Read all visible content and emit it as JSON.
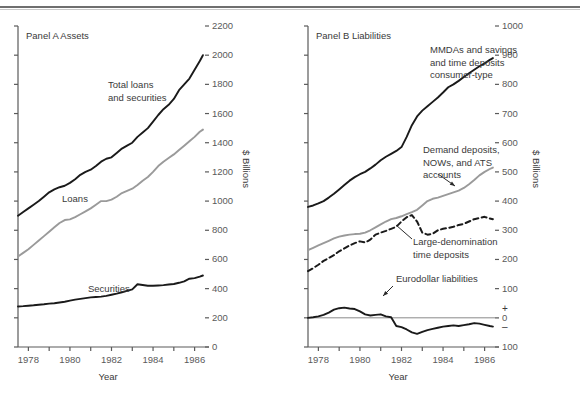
{
  "figure": {
    "panels": [
      {
        "id": "A",
        "title": "Panel A Assets",
        "xlabel": "Year",
        "ylabel": "$ Billions",
        "yticks": [
          "0",
          "200",
          "400",
          "600",
          "800",
          "1000",
          "1200",
          "1400",
          "1600",
          "1800",
          "2000",
          "2200"
        ],
        "xticks": [
          "1978",
          "1980",
          "1982",
          "1984",
          "1986"
        ],
        "annotations": [
          {
            "name": "total-loans-and-securities",
            "lines": [
              "Total loans",
              "and securities"
            ]
          },
          {
            "name": "loans",
            "lines": [
              "Loans"
            ]
          },
          {
            "name": "securities",
            "lines": [
              "Securities"
            ]
          }
        ]
      },
      {
        "id": "B",
        "title": "Panel B Liabilities",
        "xlabel": "Year",
        "ylabel": "$ Billions",
        "yticks": [
          "100",
          "0",
          "100",
          "200",
          "300",
          "400",
          "500",
          "600",
          "700",
          "800",
          "900",
          "1000"
        ],
        "xticks": [
          "1978",
          "1980",
          "1982",
          "1984",
          "1986"
        ],
        "signs": {
          "plus": "+",
          "minus": "–"
        },
        "annotations": [
          {
            "name": "mmdas-and-savings",
            "lines": [
              "MMDAs and savings",
              "and time deposits",
              "consumer-type"
            ]
          },
          {
            "name": "demand-deposits-nows-ats",
            "lines": [
              "Demand deposits,",
              "NOWs, and ATS",
              "accounts"
            ]
          },
          {
            "name": "large-denomination-time-deposits",
            "lines": [
              "Large-denomination",
              "time deposits"
            ]
          },
          {
            "name": "eurodollar-liabilities",
            "lines": [
              "Eurodollar liabilities"
            ]
          }
        ]
      }
    ]
  },
  "chart_data": [
    {
      "type": "line",
      "title": "Panel A Assets",
      "xlabel": "Year",
      "ylabel": "$ Billions",
      "xlim": [
        1977.5,
        1986.5
      ],
      "ylim": [
        0,
        2200
      ],
      "ytick_step": 200,
      "grid": false,
      "legend": "inline-annotations",
      "series": [
        {
          "name": "Total loans and securities",
          "color": "#1a1a1a",
          "style": "solid",
          "x": [
            1977.5,
            1977.75,
            1978,
            1978.25,
            1978.5,
            1978.75,
            1979,
            1979.25,
            1979.5,
            1979.75,
            1980,
            1980.25,
            1980.5,
            1980.75,
            1981,
            1981.25,
            1981.5,
            1981.75,
            1982,
            1982.25,
            1982.5,
            1982.75,
            1983,
            1983.25,
            1983.5,
            1983.75,
            1984,
            1984.25,
            1984.5,
            1984.75,
            1985,
            1985.25,
            1985.5,
            1985.75,
            1986,
            1986.25,
            1986.4
          ],
          "values": [
            900,
            925,
            950,
            975,
            1000,
            1030,
            1060,
            1080,
            1095,
            1105,
            1125,
            1150,
            1180,
            1200,
            1215,
            1240,
            1270,
            1290,
            1300,
            1330,
            1360,
            1380,
            1400,
            1440,
            1470,
            1500,
            1545,
            1590,
            1630,
            1660,
            1700,
            1760,
            1800,
            1840,
            1900,
            1960,
            2000
          ]
        },
        {
          "name": "Loans",
          "color": "#9a9a9a",
          "style": "solid",
          "x": [
            1977.5,
            1977.75,
            1978,
            1978.25,
            1978.5,
            1978.75,
            1979,
            1979.25,
            1979.5,
            1979.75,
            1980,
            1980.25,
            1980.5,
            1980.75,
            1981,
            1981.25,
            1981.5,
            1981.75,
            1982,
            1982.25,
            1982.5,
            1982.75,
            1983,
            1983.25,
            1983.5,
            1983.75,
            1984,
            1984.25,
            1984.5,
            1984.75,
            1985,
            1985.25,
            1985.5,
            1985.75,
            1986,
            1986.25,
            1986.4
          ],
          "values": [
            620,
            645,
            670,
            700,
            730,
            760,
            790,
            820,
            850,
            870,
            875,
            890,
            910,
            930,
            950,
            975,
            1000,
            1000,
            1010,
            1030,
            1055,
            1070,
            1085,
            1110,
            1140,
            1165,
            1200,
            1240,
            1270,
            1295,
            1320,
            1350,
            1380,
            1410,
            1440,
            1475,
            1490
          ]
        },
        {
          "name": "Securities",
          "color": "#1a1a1a",
          "style": "solid",
          "x": [
            1977.5,
            1977.75,
            1978,
            1978.25,
            1978.5,
            1978.75,
            1979,
            1979.25,
            1979.5,
            1979.75,
            1980,
            1980.25,
            1980.5,
            1980.75,
            1981,
            1981.25,
            1981.5,
            1981.75,
            1982,
            1982.25,
            1982.5,
            1982.75,
            1983,
            1983.25,
            1983.5,
            1983.75,
            1984,
            1984.25,
            1984.5,
            1984.75,
            1985,
            1985.25,
            1985.5,
            1985.75,
            1986,
            1986.25,
            1986.4
          ],
          "values": [
            278,
            280,
            283,
            286,
            290,
            293,
            297,
            300,
            305,
            310,
            318,
            325,
            330,
            335,
            340,
            343,
            345,
            350,
            358,
            366,
            375,
            385,
            395,
            430,
            425,
            420,
            420,
            422,
            424,
            428,
            432,
            440,
            450,
            468,
            472,
            482,
            490
          ]
        }
      ]
    },
    {
      "type": "line",
      "title": "Panel B Liabilities",
      "xlabel": "Year",
      "ylabel": "$ Billions",
      "xlim": [
        1977.5,
        1986.5
      ],
      "ylim": [
        -100,
        1000
      ],
      "ytick_step": 100,
      "grid": false,
      "zero_reference_line": true,
      "legend": "inline-annotations",
      "series": [
        {
          "name": "MMDAs and savings and time deposits consumer-type",
          "color": "#1a1a1a",
          "style": "solid",
          "x": [
            1977.5,
            1977.75,
            1978,
            1978.25,
            1978.5,
            1978.75,
            1979,
            1979.25,
            1979.5,
            1979.75,
            1980,
            1980.25,
            1980.5,
            1980.75,
            1981,
            1981.25,
            1981.5,
            1981.75,
            1982,
            1982.25,
            1982.5,
            1982.75,
            1983,
            1983.25,
            1983.5,
            1983.75,
            1984,
            1984.25,
            1984.5,
            1984.75,
            1985,
            1985.25,
            1985.5,
            1985.75,
            1986,
            1986.25,
            1986.4
          ],
          "values": [
            380,
            385,
            392,
            400,
            412,
            425,
            440,
            455,
            470,
            482,
            492,
            500,
            512,
            525,
            540,
            552,
            562,
            572,
            585,
            620,
            660,
            690,
            710,
            725,
            740,
            755,
            772,
            790,
            800,
            812,
            825,
            838,
            850,
            862,
            872,
            884,
            890
          ]
        },
        {
          "name": "Demand deposits, NOWs, and ATS accounts",
          "color": "#9a9a9a",
          "style": "solid",
          "x": [
            1977.5,
            1977.75,
            1978,
            1978.25,
            1978.5,
            1978.75,
            1979,
            1979.25,
            1979.5,
            1979.75,
            1980,
            1980.25,
            1980.5,
            1980.75,
            1981,
            1981.25,
            1981.5,
            1981.75,
            1982,
            1982.25,
            1982.5,
            1982.75,
            1983,
            1983.25,
            1983.5,
            1983.75,
            1984,
            1984.25,
            1984.5,
            1984.75,
            1985,
            1985.25,
            1985.5,
            1985.75,
            1986,
            1986.25,
            1986.4
          ],
          "values": [
            232,
            240,
            248,
            256,
            264,
            272,
            278,
            282,
            285,
            287,
            288,
            292,
            300,
            310,
            320,
            330,
            338,
            342,
            348,
            355,
            362,
            370,
            385,
            400,
            408,
            412,
            418,
            424,
            430,
            436,
            445,
            458,
            472,
            488,
            500,
            510,
            515
          ]
        },
        {
          "name": "Large-denomination time deposits",
          "color": "#1a1a1a",
          "style": "dashed",
          "x": [
            1977.5,
            1977.75,
            1978,
            1978.25,
            1978.5,
            1978.75,
            1979,
            1979.25,
            1979.5,
            1979.75,
            1980,
            1980.25,
            1980.5,
            1980.75,
            1981,
            1981.25,
            1981.5,
            1981.75,
            1982,
            1982.25,
            1982.5,
            1982.75,
            1983,
            1983.25,
            1983.5,
            1983.75,
            1984,
            1984.25,
            1984.5,
            1984.75,
            1985,
            1985.25,
            1985.5,
            1985.75,
            1986,
            1986.25,
            1986.4
          ],
          "values": [
            160,
            170,
            182,
            195,
            205,
            215,
            228,
            238,
            248,
            256,
            262,
            258,
            268,
            285,
            292,
            298,
            305,
            312,
            330,
            345,
            352,
            330,
            292,
            285,
            288,
            300,
            305,
            308,
            312,
            318,
            322,
            330,
            338,
            342,
            346,
            340,
            338
          ]
        },
        {
          "name": "Eurodollar liabilities",
          "color": "#1a1a1a",
          "style": "solid",
          "x": [
            1977.5,
            1977.75,
            1978,
            1978.25,
            1978.5,
            1978.75,
            1979,
            1979.25,
            1979.5,
            1979.75,
            1980,
            1980.25,
            1980.5,
            1980.75,
            1981,
            1981.25,
            1981.5,
            1981.75,
            1982,
            1982.25,
            1982.5,
            1982.75,
            1983,
            1983.25,
            1983.5,
            1983.75,
            1984,
            1984.25,
            1984.5,
            1984.75,
            1985,
            1985.25,
            1985.5,
            1985.75,
            1986,
            1986.25,
            1986.4
          ],
          "values": [
            0,
            2,
            5,
            10,
            18,
            28,
            33,
            35,
            32,
            30,
            22,
            12,
            8,
            10,
            12,
            5,
            2,
            -28,
            -32,
            -40,
            -50,
            -55,
            -48,
            -42,
            -38,
            -34,
            -30,
            -28,
            -26,
            -28,
            -25,
            -22,
            -18,
            -20,
            -24,
            -28,
            -30
          ]
        }
      ]
    }
  ]
}
